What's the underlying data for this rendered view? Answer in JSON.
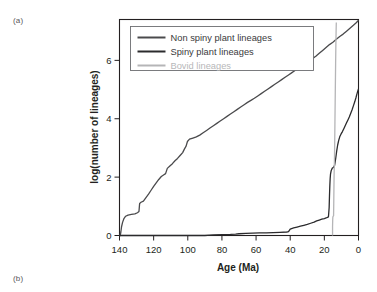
{
  "figure": {
    "panel_a_label": "(a)",
    "panel_b_label": "(b)"
  },
  "chart_data": {
    "type": "line",
    "title": "",
    "xlabel": "Age (Ma)",
    "ylabel": "log(number of lineages)",
    "xlim": [
      140,
      0
    ],
    "ylim": [
      0,
      7.4
    ],
    "x_reversed": true,
    "grid": false,
    "legend_position": "top-left-inside",
    "xticks": [
      140,
      120,
      100,
      80,
      60,
      40,
      20,
      0
    ],
    "xtick_labels": [
      "140",
      "120",
      "100",
      "80",
      "60",
      "40",
      "20",
      "0"
    ],
    "yticks": [
      0,
      2,
      4,
      6
    ],
    "ytick_labels": [
      "0",
      "2",
      "4",
      "6"
    ],
    "series": [
      {
        "name": "Non spiny plant lineages",
        "color": "#4a4a4c",
        "width": 1.3,
        "points": [
          [
            140.0,
            0.0
          ],
          [
            139.6,
            0.0
          ],
          [
            139.2,
            0.12
          ],
          [
            138.8,
            0.3
          ],
          [
            138.2,
            0.45
          ],
          [
            137.4,
            0.58
          ],
          [
            136.4,
            0.66
          ],
          [
            135.0,
            0.7
          ],
          [
            133.0,
            0.72
          ],
          [
            131.0,
            0.74
          ],
          [
            129.5,
            0.78
          ],
          [
            128.6,
            0.82
          ],
          [
            128.2,
            1.1
          ],
          [
            127.4,
            1.14
          ],
          [
            126.0,
            1.18
          ],
          [
            124.5,
            1.3
          ],
          [
            123.0,
            1.42
          ],
          [
            121.5,
            1.55
          ],
          [
            120.0,
            1.68
          ],
          [
            118.5,
            1.8
          ],
          [
            117.0,
            1.92
          ],
          [
            115.5,
            2.02
          ],
          [
            114.0,
            2.08
          ],
          [
            113.0,
            2.12
          ],
          [
            112.0,
            2.3
          ],
          [
            110.5,
            2.38
          ],
          [
            109.0,
            2.46
          ],
          [
            107.5,
            2.56
          ],
          [
            106.0,
            2.64
          ],
          [
            104.5,
            2.74
          ],
          [
            103.0,
            2.84
          ],
          [
            102.0,
            2.96
          ],
          [
            101.0,
            3.06
          ],
          [
            100.2,
            3.22
          ],
          [
            99.0,
            3.3
          ],
          [
            97.0,
            3.34
          ],
          [
            95.0,
            3.38
          ],
          [
            93.0,
            3.44
          ],
          [
            91.0,
            3.52
          ],
          [
            89.0,
            3.6
          ],
          [
            87.0,
            3.68
          ],
          [
            85.0,
            3.76
          ],
          [
            83.0,
            3.84
          ],
          [
            81.0,
            3.92
          ],
          [
            79.0,
            4.0
          ],
          [
            77.0,
            4.08
          ],
          [
            75.0,
            4.16
          ],
          [
            73.0,
            4.24
          ],
          [
            71.0,
            4.32
          ],
          [
            69.0,
            4.4
          ],
          [
            67.0,
            4.48
          ],
          [
            65.0,
            4.56
          ],
          [
            63.0,
            4.63
          ],
          [
            61.0,
            4.7
          ],
          [
            59.0,
            4.78
          ],
          [
            57.0,
            4.86
          ],
          [
            55.0,
            4.94
          ],
          [
            53.0,
            5.02
          ],
          [
            51.0,
            5.1
          ],
          [
            49.0,
            5.18
          ],
          [
            47.0,
            5.26
          ],
          [
            45.0,
            5.34
          ],
          [
            43.0,
            5.42
          ],
          [
            41.0,
            5.5
          ],
          [
            39.0,
            5.58
          ],
          [
            37.0,
            5.66
          ],
          [
            35.0,
            5.74
          ],
          [
            33.0,
            5.82
          ],
          [
            31.0,
            5.9
          ],
          [
            29.0,
            5.98
          ],
          [
            27.0,
            6.06
          ],
          [
            25.0,
            6.14
          ],
          [
            23.0,
            6.24
          ],
          [
            21.0,
            6.34
          ],
          [
            19.0,
            6.44
          ],
          [
            17.0,
            6.54
          ],
          [
            15.0,
            6.62
          ],
          [
            13.0,
            6.72
          ],
          [
            11.0,
            6.82
          ],
          [
            9.0,
            6.9
          ],
          [
            7.0,
            7.0
          ],
          [
            5.0,
            7.1
          ],
          [
            3.0,
            7.2
          ],
          [
            1.5,
            7.28
          ],
          [
            0.5,
            7.34
          ],
          [
            0.0,
            7.38
          ]
        ]
      },
      {
        "name": "Spiny plant lineages",
        "color": "#2b2b2d",
        "width": 1.3,
        "points": [
          [
            140.0,
            0.0
          ],
          [
            120.0,
            0.0
          ],
          [
            100.0,
            0.0
          ],
          [
            90.0,
            0.0
          ],
          [
            85.0,
            0.02
          ],
          [
            80.0,
            0.03
          ],
          [
            75.0,
            0.04
          ],
          [
            72.0,
            0.05
          ],
          [
            70.0,
            0.06
          ],
          [
            66.0,
            0.07
          ],
          [
            62.0,
            0.08
          ],
          [
            58.0,
            0.09
          ],
          [
            54.0,
            0.09
          ],
          [
            50.0,
            0.1
          ],
          [
            46.0,
            0.11
          ],
          [
            42.0,
            0.12
          ],
          [
            41.0,
            0.13
          ],
          [
            40.0,
            0.22
          ],
          [
            38.0,
            0.26
          ],
          [
            36.0,
            0.29
          ],
          [
            34.0,
            0.32
          ],
          [
            32.0,
            0.35
          ],
          [
            30.0,
            0.38
          ],
          [
            28.0,
            0.42
          ],
          [
            26.0,
            0.46
          ],
          [
            24.5,
            0.5
          ],
          [
            23.0,
            0.53
          ],
          [
            21.5,
            0.56
          ],
          [
            20.0,
            0.58
          ],
          [
            19.0,
            0.6
          ],
          [
            18.2,
            0.62
          ],
          [
            17.6,
            0.64
          ],
          [
            17.2,
            0.95
          ],
          [
            17.0,
            1.35
          ],
          [
            16.8,
            1.7
          ],
          [
            16.6,
            1.95
          ],
          [
            16.4,
            2.1
          ],
          [
            16.0,
            2.22
          ],
          [
            15.4,
            2.3
          ],
          [
            14.6,
            2.34
          ],
          [
            14.0,
            2.4
          ],
          [
            13.4,
            2.62
          ],
          [
            12.8,
            2.88
          ],
          [
            12.2,
            3.1
          ],
          [
            11.6,
            3.26
          ],
          [
            11.0,
            3.38
          ],
          [
            10.2,
            3.48
          ],
          [
            9.4,
            3.56
          ],
          [
            8.6,
            3.66
          ],
          [
            7.8,
            3.76
          ],
          [
            7.0,
            3.86
          ],
          [
            6.2,
            3.96
          ],
          [
            5.4,
            4.06
          ],
          [
            4.6,
            4.18
          ],
          [
            3.8,
            4.3
          ],
          [
            3.0,
            4.44
          ],
          [
            2.2,
            4.58
          ],
          [
            1.5,
            4.72
          ],
          [
            0.9,
            4.85
          ],
          [
            0.4,
            4.95
          ],
          [
            0.0,
            5.02
          ]
        ]
      },
      {
        "name": "Bovid lineages",
        "color": "#b5b5b7",
        "width": 1.3,
        "points": [
          [
            15.2,
            0.0
          ],
          [
            15.2,
            0.3
          ],
          [
            15.1,
            0.55
          ],
          [
            15.0,
            0.64
          ],
          [
            14.8,
            0.66
          ],
          [
            14.6,
            0.68
          ],
          [
            14.5,
            1.1
          ],
          [
            14.4,
            1.6
          ],
          [
            14.3,
            2.05
          ],
          [
            14.2,
            2.3
          ],
          [
            14.1,
            2.55
          ],
          [
            14.0,
            2.95
          ],
          [
            13.9,
            3.4
          ],
          [
            13.8,
            3.9
          ],
          [
            13.7,
            4.4
          ],
          [
            13.6,
            4.9
          ],
          [
            13.5,
            5.4
          ],
          [
            13.4,
            5.9
          ],
          [
            13.3,
            6.35
          ],
          [
            13.2,
            6.75
          ],
          [
            13.1,
            7.05
          ],
          [
            13.0,
            7.3
          ]
        ]
      }
    ],
    "legend": [
      {
        "label": "Non spiny plant lineages",
        "color": "#4a4a4c",
        "muted": false
      },
      {
        "label": "Spiny plant lineages",
        "color": "#2b2b2d",
        "muted": false
      },
      {
        "label": "Bovid lineages",
        "color": "#b5b5b7",
        "muted": true
      }
    ]
  }
}
